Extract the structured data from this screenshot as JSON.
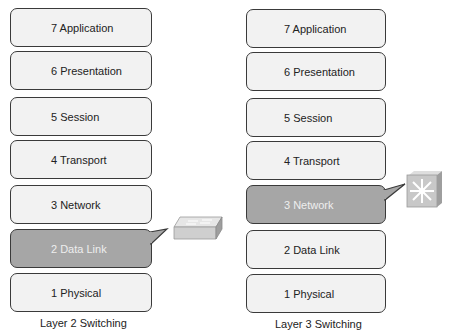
{
  "diagrams": [
    {
      "caption": "Layer 2 Switching",
      "layers": [
        "7 Application",
        "6 Presentation",
        "5 Session",
        "4 Transport",
        "3 Network",
        "2 Data Link",
        "1 Physical"
      ],
      "highlighted": "2 Data Link",
      "device": "layer2-switch-icon"
    },
    {
      "caption": "Layer 3 Switching",
      "layers": [
        "7 Application",
        "6 Presentation",
        "5 Session",
        "4 Transport",
        "3 Network",
        "2 Data Link",
        "1 Physical"
      ],
      "highlighted": "3 Network",
      "device": "layer3-switch-icon"
    }
  ],
  "colors": {
    "box_fill": "#f2f2f2",
    "highlight_fill": "#a6a6a6",
    "border": "#3a3a3a"
  }
}
